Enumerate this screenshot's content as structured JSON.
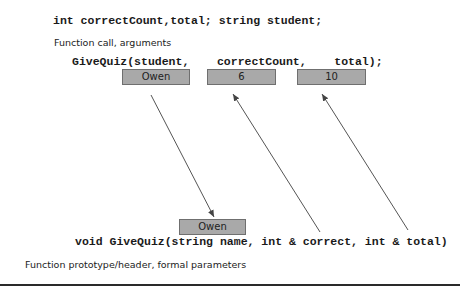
{
  "declaration": "int correctCount,total; string student;",
  "call_section": {
    "caption": "Function call, arguments",
    "code": "GiveQuiz(student,    correctCount,    total);",
    "boxes": [
      {
        "label": "student",
        "value": "Owen"
      },
      {
        "label": "correctCount",
        "value": "6"
      },
      {
        "label": "total",
        "value": "10"
      }
    ]
  },
  "header_section": {
    "code": "void GiveQuiz(string name, int & correct, int & total)",
    "caption": "Function prototype/header, formal parameters",
    "box": {
      "label": "name",
      "value": "Owen"
    }
  },
  "colors": {
    "box_fill": "#a9a9a9",
    "box_border": "#6f6f6f",
    "arrow": "#555555",
    "text": "#1a1a1a"
  }
}
